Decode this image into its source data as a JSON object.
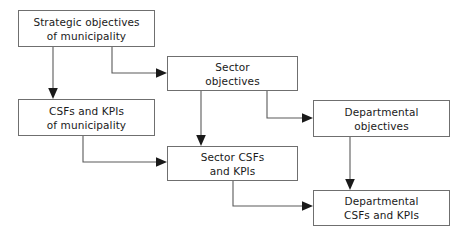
{
  "diagram": {
    "stroke_color": "#6f6f6f",
    "edge_color": "#5a5a5a",
    "text_color": "#1a1a1a",
    "background_color": "#ffffff",
    "nodes": [
      {
        "id": "strategic-objectives",
        "line1": "Strategic objectives",
        "line2": "of municipality",
        "x": 18,
        "y": 10,
        "w": 137,
        "h": 37
      },
      {
        "id": "sector-objectives",
        "line1": "Sector",
        "line2": "objectives",
        "x": 167,
        "y": 56,
        "w": 131,
        "h": 35
      },
      {
        "id": "csfs-kpis-municipality",
        "line1": "CSFs and KPIs",
        "line2": "of municipality",
        "x": 18,
        "y": 99,
        "w": 137,
        "h": 37
      },
      {
        "id": "departmental-objectives",
        "line1": "Departmental",
        "line2": "objectives",
        "x": 313,
        "y": 100,
        "w": 137,
        "h": 37
      },
      {
        "id": "sector-csfs-kpis",
        "line1": "Sector CSFs",
        "line2": "and KPIs",
        "x": 167,
        "y": 146,
        "w": 131,
        "h": 35
      },
      {
        "id": "departmental-csfs-kpis",
        "line1": "Departmental",
        "line2": "CSFs and KPIs",
        "x": 313,
        "y": 190,
        "w": 137,
        "h": 36
      }
    ],
    "edges": [
      {
        "id": "strategic-to-csfs",
        "from": "strategic-objectives",
        "to": "csfs-kpis-municipality",
        "path": "M 53,47 L 53,92",
        "arrow_at": "53,99",
        "arrow_dir": "down"
      },
      {
        "id": "strategic-to-sector-objectives",
        "from": "strategic-objectives",
        "to": "sector-objectives",
        "path": "M 112,47 L 112,73 L 160,73",
        "arrow_at": "167,73",
        "arrow_dir": "right"
      },
      {
        "id": "sector-objectives-to-sector-csfs",
        "from": "sector-objectives",
        "to": "sector-csfs-kpis",
        "path": "M 201,91 L 201,139",
        "arrow_at": "201,146",
        "arrow_dir": "down"
      },
      {
        "id": "sector-objectives-to-departmental-objectives",
        "from": "sector-objectives",
        "to": "departmental-objectives",
        "path": "M 267,91 L 267,118 L 306,118",
        "arrow_at": "313,118",
        "arrow_dir": "right"
      },
      {
        "id": "csfs-to-sector-csfs",
        "from": "csfs-kpis-municipality",
        "to": "sector-csfs-kpis",
        "path": "M 83,136 L 83,162 L 160,162",
        "arrow_at": "167,162",
        "arrow_dir": "right"
      },
      {
        "id": "departmental-objectives-to-departmental-csfs",
        "from": "departmental-objectives",
        "to": "departmental-csfs-kpis",
        "path": "M 350,137 L 350,183",
        "arrow_at": "350,190",
        "arrow_dir": "down"
      },
      {
        "id": "sector-csfs-to-departmental-csfs",
        "from": "sector-csfs-kpis",
        "to": "departmental-csfs-kpis",
        "path": "M 233,181 L 233,206 L 306,206",
        "arrow_at": "313,206",
        "arrow_dir": "right"
      }
    ]
  }
}
